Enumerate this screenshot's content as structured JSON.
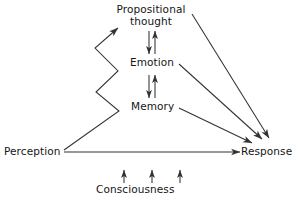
{
  "diagram": {
    "background_color": "#ffffff",
    "stroke_color": "#333333",
    "text_color": "#151515",
    "nodes": [
      {
        "id": "propositional",
        "label_line1": "Propositional",
        "label_line2": "thought",
        "x": 151,
        "y": 14
      },
      {
        "id": "emotion",
        "label": "Emotion",
        "x": 152,
        "y": 63
      },
      {
        "id": "memory",
        "label": "Memory",
        "x": 152,
        "y": 107
      },
      {
        "id": "perception",
        "label": "Perception",
        "x": 33,
        "y": 152
      },
      {
        "id": "response",
        "label": "Response",
        "x": 268,
        "y": 152
      },
      {
        "id": "consciousness",
        "label": "Consciousness",
        "x": 152,
        "y": 190
      }
    ],
    "edges": [
      {
        "from": "perception",
        "to": "propositional",
        "style": "zigzag",
        "arrow": "end"
      },
      {
        "from": "propositional",
        "to": "emotion",
        "style": "double-vertical",
        "arrow": "both"
      },
      {
        "from": "emotion",
        "to": "memory",
        "style": "double-vertical",
        "arrow": "both"
      },
      {
        "from": "propositional",
        "to": "response",
        "style": "straight",
        "arrow": "end"
      },
      {
        "from": "emotion",
        "to": "response",
        "style": "straight",
        "arrow": "end"
      },
      {
        "from": "memory",
        "to": "response",
        "style": "straight",
        "arrow": "end"
      },
      {
        "from": "perception",
        "to": "response",
        "style": "straight-horizontal",
        "arrow": "end"
      },
      {
        "from": "consciousness",
        "to": "propositional",
        "style": "short-up-tick",
        "arrow": "end"
      },
      {
        "from": "consciousness",
        "to": "emotion",
        "style": "short-up-tick",
        "arrow": "end"
      },
      {
        "from": "consciousness",
        "to": "memory",
        "style": "short-up-tick",
        "arrow": "end"
      }
    ]
  }
}
